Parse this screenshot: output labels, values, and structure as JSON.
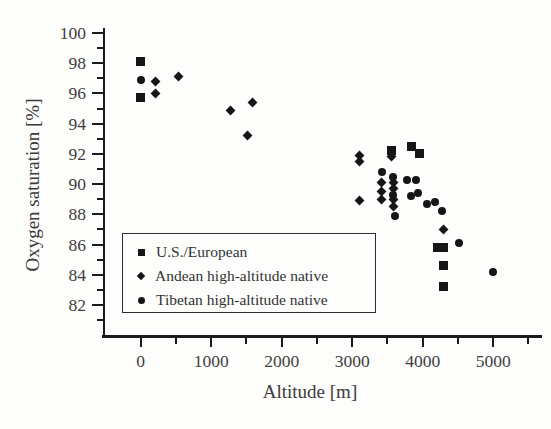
{
  "figure": {
    "background": "#fdfdfc",
    "ink_color": "#1b1b1b",
    "text_color": "#3e3e3e"
  },
  "chart_data": {
    "type": "scatter",
    "title": "",
    "xlabel": "Altitude [m]",
    "ylabel": "Oxygen saturation [%]",
    "xlim": [
      -530,
      5660
    ],
    "ylim": [
      80.2,
      100.4
    ],
    "grid": false,
    "legend_position": "lower-left",
    "x_ticks_major": [
      0,
      1000,
      2000,
      3000,
      4000,
      5000
    ],
    "x_ticks_minor": [
      500,
      1500,
      2500,
      3500,
      4500,
      5500
    ],
    "y_ticks_major": [
      82,
      84,
      86,
      88,
      90,
      92,
      94,
      96,
      98,
      100
    ],
    "y_ticks_minor": [
      81,
      83,
      85,
      87,
      89,
      91,
      93,
      95,
      97,
      99
    ],
    "series": [
      {
        "name": "U.S./European",
        "marker": "square",
        "points": [
          [
            0,
            98.1
          ],
          [
            0,
            95.7
          ],
          [
            3555,
            92.2
          ],
          [
            3840,
            92.5
          ],
          [
            3960,
            92.0
          ],
          [
            4210,
            85.8
          ],
          [
            4300,
            85.8
          ],
          [
            4290,
            84.6
          ],
          [
            4290,
            83.2
          ]
        ]
      },
      {
        "name": "Andean high-altitude native",
        "marker": "diamond",
        "points": [
          [
            210,
            96.8
          ],
          [
            210,
            96.0
          ],
          [
            530,
            97.1
          ],
          [
            1280,
            94.9
          ],
          [
            1520,
            93.2
          ],
          [
            1590,
            95.4
          ],
          [
            3100,
            91.9
          ],
          [
            3100,
            91.5
          ],
          [
            3100,
            88.9
          ],
          [
            3420,
            90.1
          ],
          [
            3420,
            89.5
          ],
          [
            3420,
            89.0
          ],
          [
            3560,
            91.8
          ],
          [
            3585,
            90.1
          ],
          [
            3585,
            89.7
          ],
          [
            3585,
            89.0
          ],
          [
            3585,
            88.5
          ],
          [
            4300,
            87.0
          ]
        ]
      },
      {
        "name": "Tibetan high-altitude native",
        "marker": "circle",
        "points": [
          [
            0,
            96.9
          ],
          [
            3420,
            90.8
          ],
          [
            3585,
            90.5
          ],
          [
            3585,
            89.3
          ],
          [
            3610,
            87.9
          ],
          [
            3780,
            90.3
          ],
          [
            3840,
            89.2
          ],
          [
            3910,
            90.3
          ],
          [
            3940,
            89.4
          ],
          [
            4060,
            88.7
          ],
          [
            4170,
            88.8
          ],
          [
            4280,
            88.2
          ],
          [
            4520,
            86.1
          ],
          [
            5000,
            84.2
          ]
        ]
      }
    ]
  }
}
